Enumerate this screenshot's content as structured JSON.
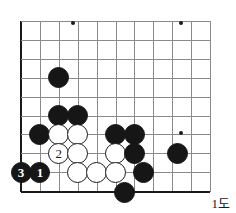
{
  "diagram": {
    "caption": "1도",
    "board": {
      "cols": 11,
      "rows": 10,
      "origin_x": 21,
      "origin_y": 21,
      "spacing": 18.9,
      "line_color": "#8a8a8a",
      "edge_color": "#1a1a1a",
      "black_color": "#161616",
      "white_color": "#ffffff"
    },
    "hoshi": [
      {
        "col": 2.75,
        "row": 0.1
      },
      {
        "col": 8.45,
        "row": 0.1
      },
      {
        "col": 8.45,
        "row": 5.95
      }
    ],
    "stones": [
      {
        "color": "black",
        "col": 2,
        "row": 3,
        "label": ""
      },
      {
        "color": "black",
        "col": 2,
        "row": 5,
        "label": ""
      },
      {
        "color": "black",
        "col": 3,
        "row": 5,
        "label": ""
      },
      {
        "color": "black",
        "col": 1,
        "row": 6,
        "label": ""
      },
      {
        "color": "white",
        "col": 2,
        "row": 6,
        "label": ""
      },
      {
        "color": "white",
        "col": 3,
        "row": 6,
        "label": ""
      },
      {
        "color": "black",
        "col": 5,
        "row": 6,
        "label": ""
      },
      {
        "color": "black",
        "col": 6,
        "row": 6,
        "label": ""
      },
      {
        "color": "white",
        "col": 2,
        "row": 7,
        "label": "2"
      },
      {
        "color": "white",
        "col": 3,
        "row": 7,
        "label": ""
      },
      {
        "color": "white",
        "col": 5,
        "row": 7,
        "label": ""
      },
      {
        "color": "black",
        "col": 6,
        "row": 7,
        "label": ""
      },
      {
        "color": "black",
        "col": 8.3,
        "row": 7,
        "label": ""
      },
      {
        "color": "black",
        "col": 0,
        "row": 8,
        "label": "3"
      },
      {
        "color": "black",
        "col": 1,
        "row": 8,
        "label": "1"
      },
      {
        "color": "white",
        "col": 3,
        "row": 8,
        "label": ""
      },
      {
        "color": "white",
        "col": 4,
        "row": 8,
        "label": ""
      },
      {
        "color": "white",
        "col": 5,
        "row": 8,
        "label": ""
      },
      {
        "color": "black",
        "col": 6.5,
        "row": 8,
        "label": ""
      },
      {
        "color": "black",
        "col": 5.5,
        "row": 9.1,
        "label": ""
      }
    ]
  }
}
